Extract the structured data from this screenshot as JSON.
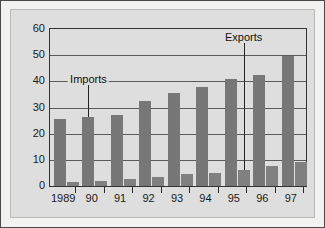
{
  "chart_data": {
    "type": "bar",
    "title": "",
    "xlabel": "",
    "ylabel": "",
    "ylim": [
      0,
      60
    ],
    "yticks": [
      0,
      10,
      20,
      30,
      40,
      50,
      60
    ],
    "grid": true,
    "legend_position": "annotations-inline",
    "categories": [
      "1989",
      "90",
      "91",
      "92",
      "93",
      "94",
      "95",
      "96",
      "97"
    ],
    "series": [
      {
        "name": "Imports",
        "color": "#777777",
        "values": [
          25.5,
          26.5,
          27.0,
          32.5,
          35.5,
          38.0,
          41.0,
          42.5,
          49.5
        ]
      },
      {
        "name": "Exports",
        "color": "#808080",
        "values": [
          1.5,
          2.0,
          2.5,
          3.5,
          4.5,
          5.0,
          6.0,
          7.5,
          9.0
        ]
      }
    ],
    "annotations": [
      {
        "text": "Imports",
        "points_to_category": "90",
        "points_to_series": "Imports"
      },
      {
        "text": "Exports",
        "points_to_category": "95",
        "points_to_series": "Exports"
      }
    ]
  },
  "colors": {
    "outer_border": "#4a4a4a",
    "page_background": "#f2f2f0",
    "plot_background": "#dedede",
    "axis": "#333333",
    "gridline": "#5a5a5a",
    "bar_imports": "#777777",
    "bar_exports": "#808080",
    "text": "#1a1a1a"
  }
}
